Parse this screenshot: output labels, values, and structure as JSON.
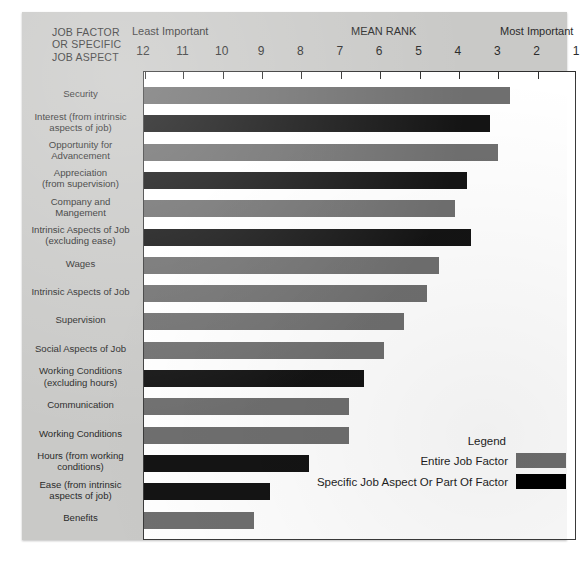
{
  "header": {
    "corner_title_lines": [
      "JOB FACTOR",
      "OR SPECIFIC",
      "JOB ASPECT"
    ],
    "least_important": "Least Important",
    "mean_rank": "MEAN RANK",
    "most_important": "Most Important"
  },
  "legend": {
    "title": "Legend",
    "entries": [
      {
        "label": "Entire Job Factor",
        "type": "entire",
        "color": "#6f6f6f"
      },
      {
        "label": "Specific Job Aspect Or Part Of Factor",
        "type": "specific",
        "color": "#000000"
      }
    ]
  },
  "colors": {
    "entire_job_factor": "#6f6f6f",
    "specific_job_aspect": "#000000",
    "paper": "#c9c9c7",
    "plot_background": "#ffffff",
    "axis": "#2e2e2e"
  },
  "chart_data": {
    "type": "bar",
    "orientation": "horizontal",
    "title": "MEAN RANK",
    "xlabel": "MEAN RANK",
    "ylabel": "JOB FACTOR OR SPECIFIC JOB ASPECT",
    "xlim": [
      12,
      1
    ],
    "x_ticks": [
      12,
      11,
      10,
      9,
      8,
      7,
      6,
      5,
      4,
      3,
      2,
      1
    ],
    "x_tick_labels": [
      "12",
      "11",
      "10",
      "9",
      "8",
      "7",
      "6",
      "5",
      "4",
      "3",
      "2",
      "1"
    ],
    "axis_low_caption": "Least Important",
    "axis_high_caption": "Most Important",
    "grid": false,
    "legend_position": "bottom-right",
    "categories": [
      "Security",
      "Interest (from intrinsic aspects of job)",
      "Opportunity for Advancement",
      "Appreciation (from supervision)",
      "Company and Mangement",
      "Intrinsic Aspects of Job (excluding ease)",
      "Wages",
      "Intrinsic Aspects of Job",
      "Supervision",
      "Social Aspects of Job",
      "Working Conditions (excluding hours)",
      "Communication",
      "Working Conditions",
      "Hours (from working conditions)",
      "Ease (from intrinsic aspects of job)",
      "Benefits"
    ],
    "values": [
      2.7,
      3.2,
      3.0,
      3.8,
      4.1,
      3.7,
      4.5,
      4.8,
      5.4,
      5.9,
      6.4,
      6.8,
      6.8,
      7.8,
      8.8,
      9.2
    ],
    "series": [
      {
        "name": "Entire Job Factor",
        "color": "#6f6f6f",
        "members": [
          "Security",
          "Opportunity for Advancement",
          "Company and Mangement",
          "Wages",
          "Intrinsic Aspects of Job",
          "Supervision",
          "Social Aspects of Job",
          "Communication",
          "Working Conditions",
          "Benefits"
        ]
      },
      {
        "name": "Specific Job Aspect Or Part Of Factor",
        "color": "#000000",
        "members": [
          "Interest (from intrinsic aspects of job)",
          "Appreciation (from supervision)",
          "Intrinsic Aspects of Job (excluding ease)",
          "Working Conditions (excluding hours)",
          "Hours (from working conditions)",
          "Ease (from intrinsic aspects of job)"
        ]
      }
    ],
    "bars": [
      {
        "label_lines": [
          "Security"
        ],
        "value": 2.7,
        "type": "entire"
      },
      {
        "label_lines": [
          "Interest (from intrinsic",
          "aspects of job)"
        ],
        "value": 3.2,
        "type": "specific"
      },
      {
        "label_lines": [
          "Opportunity for",
          "Advancement"
        ],
        "value": 3.0,
        "type": "entire"
      },
      {
        "label_lines": [
          "Appreciation",
          "(from supervision)"
        ],
        "value": 3.8,
        "type": "specific"
      },
      {
        "label_lines": [
          "Company and",
          "Mangement"
        ],
        "value": 4.1,
        "type": "entire"
      },
      {
        "label_lines": [
          "Intrinsic Aspects of Job",
          "(excluding ease)"
        ],
        "value": 3.7,
        "type": "specific"
      },
      {
        "label_lines": [
          "Wages"
        ],
        "value": 4.5,
        "type": "entire"
      },
      {
        "label_lines": [
          "Intrinsic Aspects of Job"
        ],
        "value": 4.8,
        "type": "entire"
      },
      {
        "label_lines": [
          "Supervision"
        ],
        "value": 5.4,
        "type": "entire"
      },
      {
        "label_lines": [
          "Social Aspects of Job"
        ],
        "value": 5.9,
        "type": "entire"
      },
      {
        "label_lines": [
          "Working Conditions",
          "(excluding hours)"
        ],
        "value": 6.4,
        "type": "specific"
      },
      {
        "label_lines": [
          "Communication"
        ],
        "value": 6.8,
        "type": "entire"
      },
      {
        "label_lines": [
          "Working Conditions"
        ],
        "value": 6.8,
        "type": "entire"
      },
      {
        "label_lines": [
          "Hours (from working",
          "conditions)"
        ],
        "value": 7.8,
        "type": "specific"
      },
      {
        "label_lines": [
          "Ease (from intrinsic",
          "aspects of job)"
        ],
        "value": 8.8,
        "type": "specific"
      },
      {
        "label_lines": [
          "Benefits"
        ],
        "value": 9.2,
        "type": "entire"
      }
    ]
  }
}
